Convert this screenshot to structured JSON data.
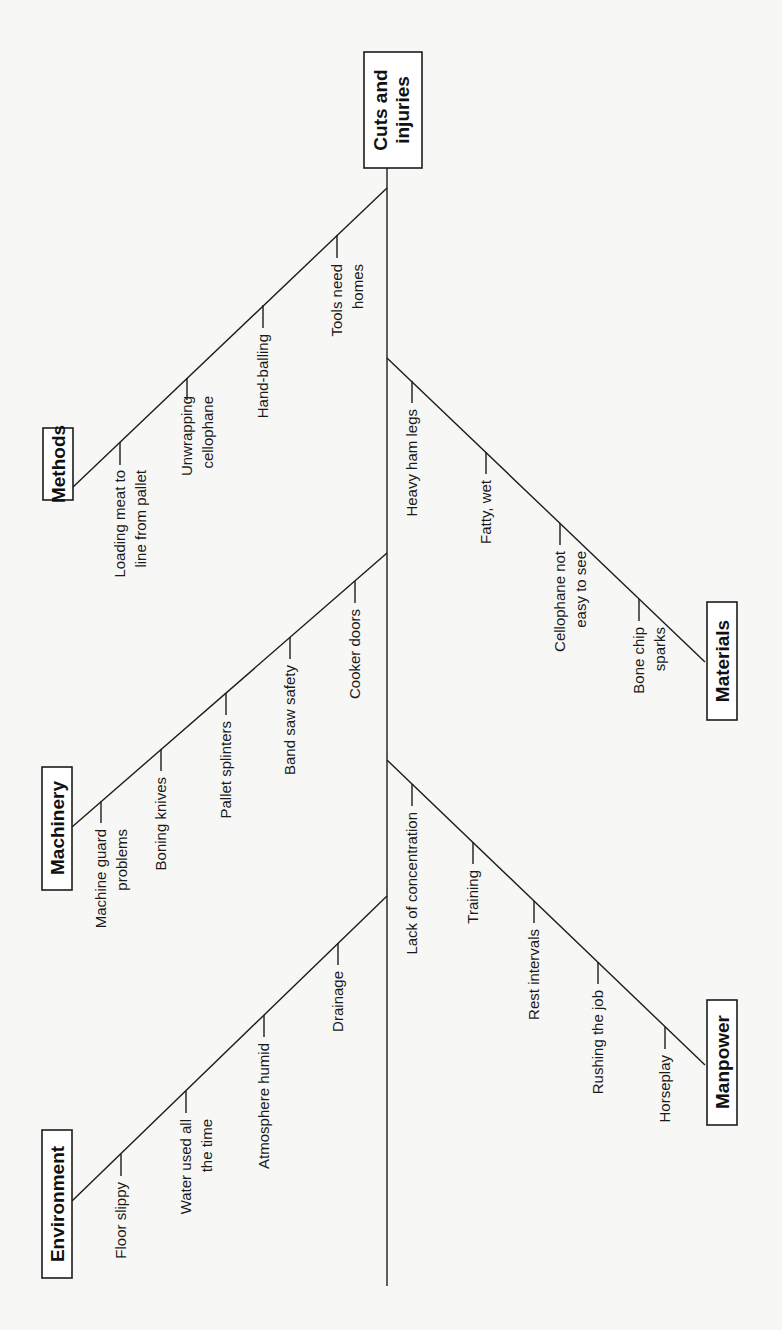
{
  "diagram": {
    "type": "fishbone",
    "orientation": "rotated-90-ccw",
    "effect": {
      "lines": [
        "Cuts and",
        "injuries"
      ]
    },
    "categories": [
      {
        "name": "Methods",
        "side": "left",
        "causes": [
          {
            "lines": [
              "Loading meat to",
              "line from pallet"
            ]
          },
          {
            "lines": [
              "Unwrapping",
              "cellophane"
            ]
          },
          {
            "lines": [
              "Hand-balling"
            ]
          },
          {
            "lines": [
              "Tools need",
              "homes"
            ]
          }
        ]
      },
      {
        "name": "Materials",
        "side": "right",
        "causes": [
          {
            "lines": [
              "Heavy ham legs"
            ]
          },
          {
            "lines": [
              "Fatty, wet"
            ]
          },
          {
            "lines": [
              "Cellophane not",
              "easy to see"
            ]
          },
          {
            "lines": [
              "Bone chip",
              "sparks"
            ]
          }
        ]
      },
      {
        "name": "Machinery",
        "side": "left",
        "causes": [
          {
            "lines": [
              "Machine guard",
              "problems"
            ]
          },
          {
            "lines": [
              "Boning knives"
            ]
          },
          {
            "lines": [
              "Pallet splinters"
            ]
          },
          {
            "lines": [
              "Band saw safety"
            ]
          },
          {
            "lines": [
              "Cooker doors"
            ]
          }
        ]
      },
      {
        "name": "Manpower",
        "side": "right",
        "causes": [
          {
            "lines": [
              "Lack of concentration"
            ]
          },
          {
            "lines": [
              "Training"
            ]
          },
          {
            "lines": [
              "Rest intervals"
            ]
          },
          {
            "lines": [
              "Rushing the job"
            ]
          },
          {
            "lines": [
              "Horseplay"
            ]
          }
        ]
      },
      {
        "name": "Environment",
        "side": "left",
        "causes": [
          {
            "lines": [
              "Floor slippy"
            ]
          },
          {
            "lines": [
              "Water used all",
              "the time"
            ]
          },
          {
            "lines": [
              "Atmosphere humid"
            ]
          },
          {
            "lines": [
              "Drainage"
            ]
          }
        ]
      }
    ]
  },
  "colors": {
    "background": "#f7f7f5",
    "ink": "#1c1c1c",
    "box_fill": "#ffffff"
  }
}
